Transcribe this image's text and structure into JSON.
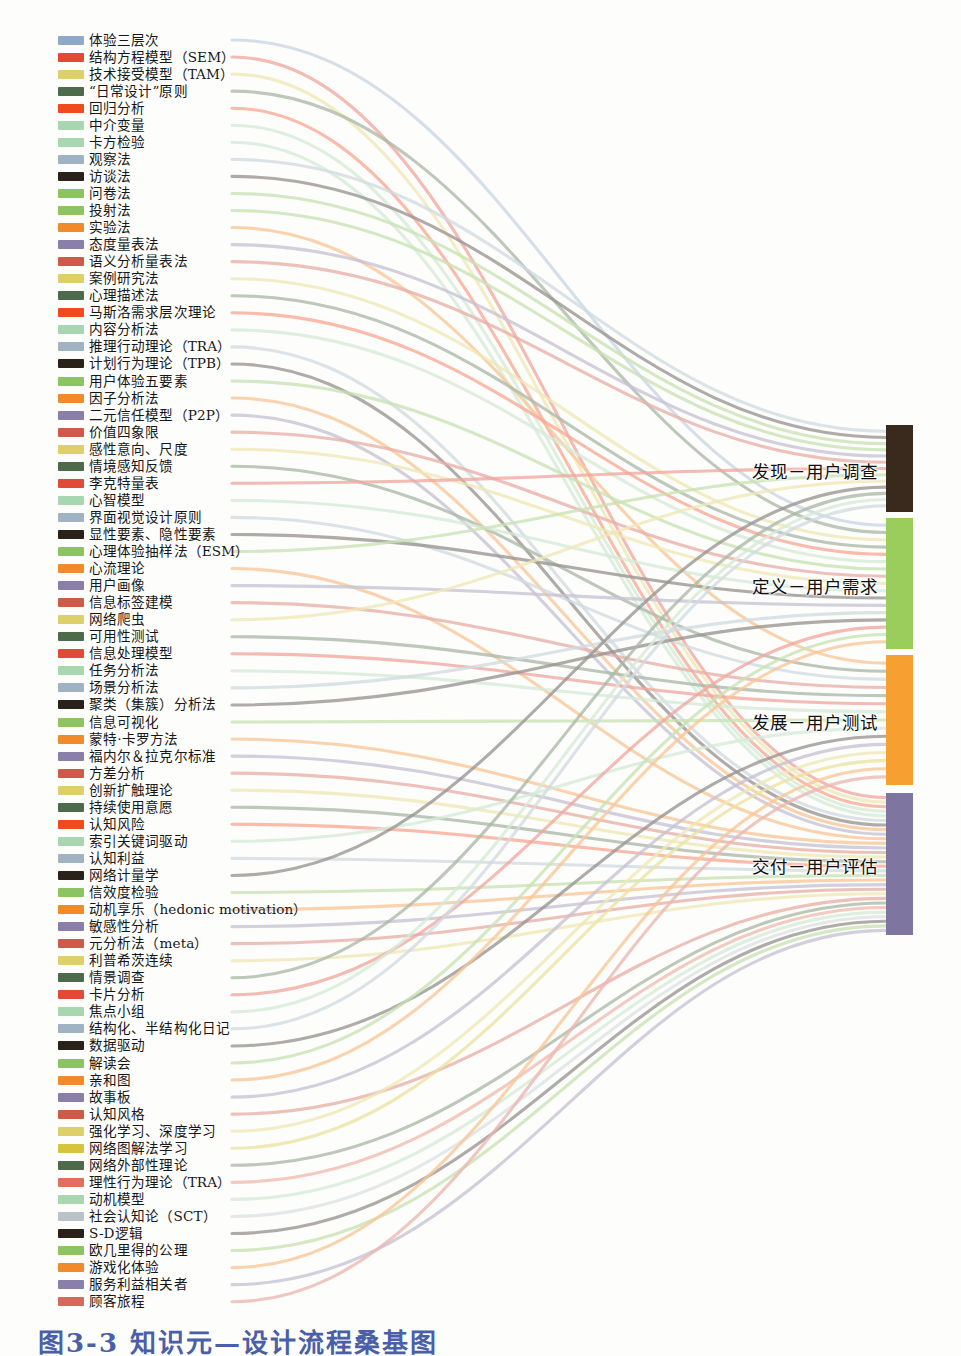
{
  "figure": {
    "type": "sankey-diagram",
    "caption": "图3-3 知识元—设计流程桑基图",
    "caption_color": "#4a5fa8",
    "background": "#fdfdfb"
  },
  "chart_data": {
    "type": "sankey",
    "title": "图3-3 知识元—设计流程桑基图",
    "xlabel": "",
    "ylabel": "",
    "legend": "left-node-list",
    "grid": false,
    "palette": [
      "#8fa9c9",
      "#e04a36",
      "#ddd06a",
      "#4d6b4a",
      "#f04a1e",
      "#a8d6b0",
      "#9fb3c2",
      "#2b211b",
      "#8cc462",
      "#f08a2a",
      "#8a7fa8",
      "#cf5a4a"
    ],
    "nodes_target": [
      {
        "id": "t0",
        "label": "发现－用户调查",
        "color": "#3a2a1e",
        "y": 425,
        "height": 87
      },
      {
        "id": "t1",
        "label": "定义－用户需求",
        "color": "#9acd5c",
        "y": 518,
        "height": 131
      },
      {
        "id": "t2",
        "label": "发展－用户测试",
        "color": "#f5a030",
        "y": 655,
        "height": 130
      },
      {
        "id": "t3",
        "label": "交付－用户评估",
        "color": "#7e75a0",
        "y": 793,
        "height": 142
      }
    ],
    "nodes_source": [
      {
        "label": "体验三层次",
        "color": "#8fa9c9",
        "links": [
          "t1"
        ]
      },
      {
        "label": "结构方程模型（SEM）",
        "color": "#e04a36",
        "links": [
          "t3"
        ]
      },
      {
        "label": "技术接受模型（TAM）",
        "color": "#ddd06a",
        "links": [
          "t3"
        ]
      },
      {
        "label": "“日常设计”原则",
        "color": "#4d6b4a",
        "links": [
          "t1"
        ]
      },
      {
        "label": "回归分析",
        "color": "#f04a1e",
        "links": [
          "t3"
        ]
      },
      {
        "label": "中介变量",
        "color": "#a8d6b0",
        "links": [
          "t3"
        ]
      },
      {
        "label": "卡方检验",
        "color": "#a8d6b0",
        "links": [
          "t3"
        ]
      },
      {
        "label": "观察法",
        "color": "#9fb3c2",
        "links": [
          "t0"
        ]
      },
      {
        "label": "访谈法",
        "color": "#2b211b",
        "links": [
          "t0"
        ]
      },
      {
        "label": "问卷法",
        "color": "#8cc462",
        "links": [
          "t0"
        ]
      },
      {
        "label": "投射法",
        "color": "#8cc462",
        "links": [
          "t0"
        ]
      },
      {
        "label": "实验法",
        "color": "#f08a2a",
        "links": [
          "t2"
        ]
      },
      {
        "label": "态度量表法",
        "color": "#8a7fa8",
        "links": [
          "t0"
        ]
      },
      {
        "label": "语义分析量表法",
        "color": "#cf5a4a",
        "links": [
          "t0"
        ]
      },
      {
        "label": "案例研究法",
        "color": "#ddd06a",
        "links": [
          "t1"
        ]
      },
      {
        "label": "心理描述法",
        "color": "#4d6b4a",
        "links": [
          "t1"
        ]
      },
      {
        "label": "马斯洛需求层次理论",
        "color": "#f04a1e",
        "links": [
          "t1"
        ]
      },
      {
        "label": "内容分析法",
        "color": "#a8d6b0",
        "links": [
          "t1"
        ]
      },
      {
        "label": "推理行动理论（TRA）",
        "color": "#9fb3c2",
        "links": [
          "t3"
        ]
      },
      {
        "label": "计划行为理论（TPB）",
        "color": "#2b211b",
        "links": [
          "t3"
        ]
      },
      {
        "label": "用户体验五要素",
        "color": "#8cc462",
        "links": [
          "t1"
        ]
      },
      {
        "label": "因子分析法",
        "color": "#f08a2a",
        "links": [
          "t3"
        ]
      },
      {
        "label": "二元信任模型（P2P）",
        "color": "#8a7fa8",
        "links": [
          "t3"
        ]
      },
      {
        "label": "价值四象限",
        "color": "#cf5a4a",
        "links": [
          "t1"
        ]
      },
      {
        "label": "感性意向、尺度",
        "color": "#ddd06a",
        "links": [
          "t1"
        ]
      },
      {
        "label": "情境感知反馈",
        "color": "#4d6b4a",
        "links": [
          "t2"
        ]
      },
      {
        "label": "李克特量表",
        "color": "#e04a36",
        "links": [
          "t0"
        ]
      },
      {
        "label": "心智模型",
        "color": "#a8d6b0",
        "links": [
          "t1"
        ]
      },
      {
        "label": "界面视觉设计原则",
        "color": "#9fb3c2",
        "links": [
          "t2"
        ]
      },
      {
        "label": "显性要素、隐性要素",
        "color": "#2b211b",
        "links": [
          "t1"
        ]
      },
      {
        "label": "心理体验抽样法（ESM）",
        "color": "#8cc462",
        "links": [
          "t0"
        ]
      },
      {
        "label": "心流理论",
        "color": "#f08a2a",
        "links": [
          "t3"
        ]
      },
      {
        "label": "用户画像",
        "color": "#8a7fa8",
        "links": [
          "t1"
        ]
      },
      {
        "label": "信息标签建模",
        "color": "#cf5a4a",
        "links": [
          "t2"
        ]
      },
      {
        "label": "网络爬虫",
        "color": "#ddd06a",
        "links": [
          "t0"
        ]
      },
      {
        "label": "可用性测试",
        "color": "#4d6b4a",
        "links": [
          "t2"
        ]
      },
      {
        "label": "信息处理模型",
        "color": "#e04a36",
        "links": [
          "t2"
        ]
      },
      {
        "label": "任务分析法",
        "color": "#a8d6b0",
        "links": [
          "t2"
        ]
      },
      {
        "label": "场景分析法",
        "color": "#9fb3c2",
        "links": [
          "t1"
        ]
      },
      {
        "label": "聚类（集簇）分析法",
        "color": "#2b211b",
        "links": [
          "t1"
        ]
      },
      {
        "label": "信息可视化",
        "color": "#8cc462",
        "links": [
          "t2"
        ]
      },
      {
        "label": "蒙特·卡罗方法",
        "color": "#f08a2a",
        "links": [
          "t3"
        ]
      },
      {
        "label": "福内尔＆拉克尔标准",
        "color": "#8a7fa8",
        "links": [
          "t3"
        ]
      },
      {
        "label": "方差分析",
        "color": "#cf5a4a",
        "links": [
          "t3"
        ]
      },
      {
        "label": "创新扩触理论",
        "color": "#ddd06a",
        "links": [
          "t3"
        ]
      },
      {
        "label": "持续使用意愿",
        "color": "#4d6b4a",
        "links": [
          "t3"
        ]
      },
      {
        "label": "认知风险",
        "color": "#f04a1e",
        "links": [
          "t3"
        ]
      },
      {
        "label": "索引关键词驱动",
        "color": "#a8d6b0",
        "links": [
          "t2"
        ]
      },
      {
        "label": "认知利益",
        "color": "#9fb3c2",
        "links": [
          "t3"
        ]
      },
      {
        "label": "网络计量学",
        "color": "#2b211b",
        "links": [
          "t0"
        ]
      },
      {
        "label": "信效度检验",
        "color": "#8cc462",
        "links": [
          "t3"
        ]
      },
      {
        "label": "动机享乐（hedonic motivation）",
        "color": "#f08a2a",
        "links": [
          "t3"
        ]
      },
      {
        "label": "敏感性分析",
        "color": "#8a7fa8",
        "links": [
          "t3"
        ]
      },
      {
        "label": "元分析法（meta）",
        "color": "#cf5a4a",
        "links": [
          "t3"
        ]
      },
      {
        "label": "利普希茨连续",
        "color": "#ddd06a",
        "links": [
          "t3"
        ]
      },
      {
        "label": "情景调查",
        "color": "#4d6b4a",
        "links": [
          "t0"
        ]
      },
      {
        "label": "卡片分析",
        "color": "#e04a36",
        "links": [
          "t1"
        ]
      },
      {
        "label": "焦点小组",
        "color": "#a8d6b0",
        "links": [
          "t0"
        ]
      },
      {
        "label": "结构化、半结构化日记",
        "color": "#9fb3c2",
        "links": [
          "t0"
        ]
      },
      {
        "label": "数据驱动",
        "color": "#2b211b",
        "links": [
          "t2"
        ]
      },
      {
        "label": "解读会",
        "color": "#8cc462",
        "links": [
          "t1"
        ]
      },
      {
        "label": "亲和图",
        "color": "#f08a2a",
        "links": [
          "t1"
        ]
      },
      {
        "label": "故事板",
        "color": "#8a7fa8",
        "links": [
          "t2"
        ]
      },
      {
        "label": "认知风格",
        "color": "#cf5a4a",
        "links": [
          "t3"
        ]
      },
      {
        "label": "强化学习、深度学习",
        "color": "#ddd06a",
        "links": [
          "t2"
        ]
      },
      {
        "label": "网络图解法学习",
        "color": "#d6c43c",
        "links": [
          "t2"
        ]
      },
      {
        "label": "网络外部性理论",
        "color": "#4d6b4a",
        "links": [
          "t3"
        ]
      },
      {
        "label": "理性行为理论（TRA）",
        "color": "#e0705a",
        "links": [
          "t3"
        ]
      },
      {
        "label": "动机模型",
        "color": "#a8d6b0",
        "links": [
          "t3"
        ]
      },
      {
        "label": "社会认知论（SCT）",
        "color": "#b9c2c7",
        "links": [
          "t3"
        ]
      },
      {
        "label": "S-D逻辑",
        "color": "#2b211b",
        "links": [
          "t3"
        ]
      },
      {
        "label": "欧几里得的公理",
        "color": "#8cc462",
        "links": [
          "t3"
        ]
      },
      {
        "label": "游戏化体验",
        "color": "#f08a2a",
        "links": [
          "t2"
        ]
      },
      {
        "label": "服务利益相关者",
        "color": "#8a7fa8",
        "links": [
          "t3"
        ]
      },
      {
        "label": "顾客旅程",
        "color": "#d4695c",
        "links": [
          "t2"
        ]
      }
    ]
  }
}
